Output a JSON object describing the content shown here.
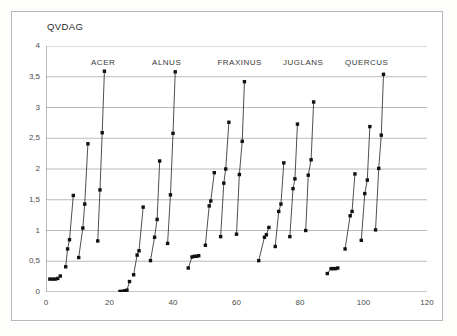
{
  "figure": {
    "title": "QVDAG",
    "background_color": "#ffffff",
    "border_color": "#b9b9b9"
  },
  "chart_data": {
    "type": "scatter",
    "title": "QVDAG",
    "xlabel": "",
    "ylabel": "",
    "xlim": [
      0,
      120
    ],
    "ylim": [
      0,
      4
    ],
    "grid": "horizontal",
    "legend": "none",
    "marker": "small filled diamond/square connected by thin line within each run",
    "line_color": "#222222",
    "marker_color": "#111111",
    "xticks": [
      0,
      20,
      40,
      60,
      80,
      100,
      120
    ],
    "xtick_labels": [
      "0",
      "20",
      "40",
      "60",
      "80",
      "100",
      "120"
    ],
    "yticks": [
      0,
      0.5,
      1,
      1.5,
      2,
      2.5,
      3,
      3.5,
      4
    ],
    "ytick_labels": [
      "0",
      "0,5",
      "1",
      "1,5",
      "2",
      "2,5",
      "3",
      "3,5",
      "4"
    ],
    "group_labels": [
      {
        "text": "ACER",
        "x": 18
      },
      {
        "text": "ALNUS",
        "x": 38
      },
      {
        "text": "FRAXINUS",
        "x": 61
      },
      {
        "text": "JUGLANS",
        "x": 81
      },
      {
        "text": "QUERCUS",
        "x": 101
      }
    ],
    "series": [
      {
        "name": "ACER-run-1",
        "group": "ACER",
        "points": [
          [
            1.2,
            0.21
          ],
          [
            2.1,
            0.21
          ],
          [
            2.9,
            0.21
          ],
          [
            3.7,
            0.22
          ],
          [
            4.5,
            0.26
          ]
        ]
      },
      {
        "name": "ACER-run-2",
        "group": "ACER",
        "points": [
          [
            6.2,
            0.41
          ],
          [
            6.8,
            0.7
          ],
          [
            7.4,
            0.85
          ],
          [
            8.6,
            1.57
          ]
        ]
      },
      {
        "name": "ACER-run-3",
        "group": "ACER",
        "points": [
          [
            10.3,
            0.56
          ],
          [
            11.6,
            1.04
          ],
          [
            12.2,
            1.43
          ],
          [
            13.2,
            2.41
          ]
        ]
      },
      {
        "name": "ACER-run-4",
        "group": "ACER",
        "points": [
          [
            16.3,
            0.83
          ],
          [
            17.0,
            1.66
          ],
          [
            17.7,
            2.59
          ],
          [
            18.4,
            3.59
          ]
        ]
      },
      {
        "name": "ALNUS-run-1",
        "group": "ALNUS",
        "points": [
          [
            23.3,
            0.01
          ],
          [
            24.1,
            0.01
          ],
          [
            24.8,
            0.02
          ],
          [
            25.5,
            0.03
          ],
          [
            26.3,
            0.17
          ]
        ]
      },
      {
        "name": "ALNUS-run-2",
        "group": "ALNUS",
        "points": [
          [
            27.6,
            0.28
          ],
          [
            28.7,
            0.6
          ],
          [
            29.3,
            0.67
          ],
          [
            30.6,
            1.38
          ]
        ]
      },
      {
        "name": "ALNUS-run-3",
        "group": "ALNUS",
        "points": [
          [
            32.9,
            0.51
          ],
          [
            34.2,
            0.89
          ],
          [
            35.0,
            1.18
          ],
          [
            35.8,
            2.13
          ]
        ]
      },
      {
        "name": "ALNUS-run-4",
        "group": "ALNUS",
        "points": [
          [
            38.3,
            0.79
          ],
          [
            39.2,
            1.58
          ],
          [
            40.0,
            2.58
          ],
          [
            40.7,
            3.58
          ]
        ]
      },
      {
        "name": "FRAXINUS-run-1",
        "group": "FRAXINUS",
        "points": [
          [
            44.8,
            0.39
          ],
          [
            46.0,
            0.57
          ],
          [
            46.7,
            0.58
          ],
          [
            47.4,
            0.58
          ],
          [
            48.1,
            0.59
          ]
        ]
      },
      {
        "name": "FRAXINUS-run-2",
        "group": "FRAXINUS",
        "points": [
          [
            50.2,
            0.76
          ],
          [
            51.4,
            1.4
          ],
          [
            51.9,
            1.48
          ],
          [
            53.0,
            1.94
          ]
        ]
      },
      {
        "name": "FRAXINUS-run-3",
        "group": "FRAXINUS",
        "points": [
          [
            55.0,
            0.9
          ],
          [
            56.0,
            1.77
          ],
          [
            56.6,
            2.0
          ],
          [
            57.6,
            2.76
          ]
        ]
      },
      {
        "name": "FRAXINUS-run-4",
        "group": "FRAXINUS",
        "points": [
          [
            60.0,
            0.94
          ],
          [
            60.9,
            1.91
          ],
          [
            61.8,
            2.45
          ],
          [
            62.5,
            3.42
          ]
        ]
      },
      {
        "name": "JUGLANS-run-1",
        "group": "JUGLANS",
        "points": [
          [
            67.0,
            0.51
          ],
          [
            68.8,
            0.89
          ],
          [
            69.4,
            0.93
          ],
          [
            70.2,
            1.05
          ]
        ]
      },
      {
        "name": "JUGLANS-run-2",
        "group": "JUGLANS",
        "points": [
          [
            72.2,
            0.74
          ],
          [
            73.3,
            1.31
          ],
          [
            74.0,
            1.43
          ],
          [
            74.9,
            2.1
          ]
        ]
      },
      {
        "name": "JUGLANS-run-3",
        "group": "JUGLANS",
        "points": [
          [
            76.8,
            0.9
          ],
          [
            77.8,
            1.68
          ],
          [
            78.4,
            1.84
          ],
          [
            79.2,
            2.73
          ]
        ]
      },
      {
        "name": "JUGLANS-run-4",
        "group": "JUGLANS",
        "points": [
          [
            81.8,
            1.0
          ],
          [
            82.6,
            1.9
          ],
          [
            83.5,
            2.15
          ],
          [
            84.3,
            3.09
          ]
        ]
      },
      {
        "name": "JUGLANS-run-5",
        "group": "JUGLANS",
        "points": [
          [
            88.6,
            0.3
          ],
          [
            89.8,
            0.38
          ],
          [
            90.5,
            0.38
          ],
          [
            91.2,
            0.38
          ],
          [
            91.9,
            0.39
          ]
        ]
      },
      {
        "name": "QUERCUS-run-1",
        "group": "QUERCUS",
        "points": [
          [
            94.2,
            0.7
          ],
          [
            95.8,
            1.24
          ],
          [
            96.4,
            1.31
          ],
          [
            97.3,
            1.92
          ]
        ]
      },
      {
        "name": "QUERCUS-run-2",
        "group": "QUERCUS",
        "points": [
          [
            99.3,
            0.84
          ],
          [
            100.4,
            1.6
          ],
          [
            101.2,
            1.82
          ],
          [
            102.0,
            2.69
          ]
        ]
      },
      {
        "name": "QUERCUS-run-3",
        "group": "QUERCUS",
        "points": [
          [
            103.8,
            1.01
          ],
          [
            104.8,
            2.01
          ],
          [
            105.6,
            2.55
          ],
          [
            106.3,
            3.54
          ]
        ]
      }
    ]
  }
}
